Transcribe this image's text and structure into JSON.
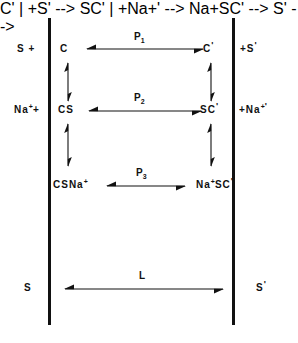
{
  "diagram": {
    "type": "reaction-scheme",
    "stroke_color": "#111111",
    "background_color": "#ffffff",
    "membranes": [
      {
        "name": "left-membrane",
        "x": 48
      },
      {
        "name": "right-membrane",
        "x": 232
      }
    ],
    "outside_labels": [
      {
        "key": "s_out",
        "text": "S +",
        "base": "S",
        "sup": "",
        "tail": " +"
      },
      {
        "key": "na_out",
        "text": "Na⁺+",
        "base": "Na",
        "sup": "+",
        "tail": "+"
      },
      {
        "key": "s_bottom_out",
        "text": "S",
        "base": "S",
        "sup": "",
        "tail": ""
      }
    ],
    "inside_labels": [
      {
        "key": "s_in",
        "text": "+S'",
        "lead": "+",
        "base": "S",
        "sup": "",
        "prime": "'"
      },
      {
        "key": "na_in",
        "text": "+Na⁺'",
        "lead": "+",
        "base": "Na",
        "sup": "+",
        "prime": "'"
      },
      {
        "key": "s_bottom_in",
        "text": "S'",
        "lead": "",
        "base": "S",
        "sup": "",
        "prime": "'"
      }
    ],
    "species_left": [
      {
        "key": "c",
        "base": "C",
        "sup": "",
        "prime": ""
      },
      {
        "key": "cs",
        "base": "CS",
        "sup": "",
        "prime": ""
      },
      {
        "key": "csna",
        "base": "CSNa",
        "sup": "+",
        "prime": ""
      }
    ],
    "species_right": [
      {
        "key": "cp",
        "base": "C",
        "sup": "",
        "prime": "'"
      },
      {
        "key": "scp",
        "base": "SC",
        "sup": "",
        "prime": "'"
      },
      {
        "key": "nascp",
        "base": "Na",
        "sup": "+",
        "mid": "SC",
        "prime": "'"
      }
    ],
    "reactions": [
      {
        "key": "p1",
        "base": "P",
        "sub": "1"
      },
      {
        "key": "p2",
        "base": "P",
        "sub": "2"
      },
      {
        "key": "p3",
        "base": "P",
        "sub": "3"
      },
      {
        "key": "l",
        "base": "L",
        "sub": ""
      }
    ]
  }
}
